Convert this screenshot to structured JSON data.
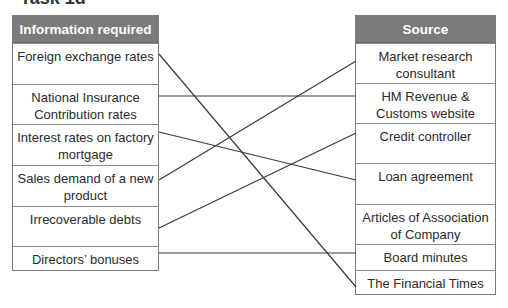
{
  "title": "Task 1d",
  "left": {
    "header": "Information required",
    "items": [
      "Foreign exchange rates",
      "National Insurance Contribution rates",
      "Interest rates on factory mortgage",
      "Sales demand of a new product",
      "Irrecoverable debts",
      "Directors’ bonuses"
    ]
  },
  "right": {
    "header": "Source",
    "items": [
      "Market research consultant",
      "HM Revenue & Customs website",
      "Credit controller",
      "Loan agreement",
      "Articles of Association of Company",
      "Board minutes",
      "The Financial Times"
    ]
  },
  "connections": [
    {
      "from": "Foreign exchange rates",
      "to": "The Financial Times"
    },
    {
      "from": "National Insurance Contribution rates",
      "to": "HM Revenue & Customs website"
    },
    {
      "from": "Interest rates on factory mortgage",
      "to": "Loan agreement"
    },
    {
      "from": "Sales demand of a new product",
      "to": "Market research consultant"
    },
    {
      "from": "Irrecoverable debts",
      "to": "Credit controller"
    },
    {
      "from": "Directors’ bonuses",
      "to": "Board minutes"
    }
  ],
  "colors": {
    "header_bg": "#7b7b7b",
    "line": "#3a3a3a"
  }
}
